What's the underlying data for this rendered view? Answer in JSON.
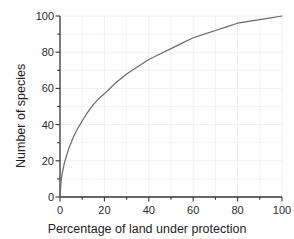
{
  "chart_data": {
    "type": "line",
    "title": "",
    "xlabel": "Percentage of land under protection",
    "ylabel": "Number of species",
    "xlim": [
      0,
      100
    ],
    "ylim": [
      0,
      100
    ],
    "grid": true,
    "legend": "none",
    "line_color": "#6b6b6b",
    "axis_color": "#333333",
    "grid_color": "#f0f0f0",
    "background_color": "#ffffff",
    "xticks": [
      0,
      20,
      40,
      60,
      80,
      100
    ],
    "yticks": [
      0,
      20,
      40,
      60,
      80,
      100
    ],
    "xtick_labels": [
      "0",
      "20",
      "40",
      "60",
      "80",
      "100"
    ],
    "ytick_labels": [
      "0",
      "20",
      "40",
      "60",
      "80",
      "100"
    ],
    "minor_tick_interval": 10,
    "series": [
      {
        "name": "species accumulation",
        "x": [
          0,
          0.5,
          1,
          2,
          3,
          4,
          5,
          6,
          8,
          10,
          12,
          15,
          18,
          20,
          25,
          30,
          35,
          40,
          45,
          50,
          55,
          60,
          65,
          70,
          75,
          80,
          85,
          90,
          95,
          100
        ],
        "y": [
          0,
          9,
          13,
          19,
          23,
          27,
          30,
          33,
          38,
          42,
          46,
          51,
          55,
          57,
          63,
          68,
          72,
          76,
          79,
          82,
          85,
          88,
          90,
          92,
          94,
          96,
          97,
          98,
          99,
          100
        ]
      }
    ]
  },
  "figure": {
    "x_axis_title": "Percentage of land under protection",
    "y_axis_title": "Number of species"
  }
}
